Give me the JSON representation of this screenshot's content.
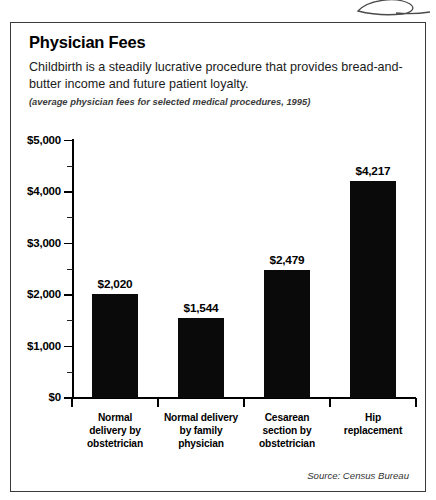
{
  "panel": {
    "title": "Physician Fees",
    "description": "Childbirth is a steadily lucrative procedure that provides bread-and-butter income and future patient loyalty.",
    "subtitle": "(average physician fees for selected medical procedures, 1995)",
    "source": "Source: Census Bureau"
  },
  "decoration": {
    "swoosh_icon": "swoosh-icon"
  },
  "chart_data": {
    "type": "bar",
    "title": "Physician Fees",
    "subtitle": "(average physician fees for selected medical procedures, 1995)",
    "description": "Childbirth is a steadily lucrative procedure that provides bread-and-butter income and future patient loyalty.",
    "source": "Source: Census Bureau",
    "xlabel": "",
    "ylabel": "",
    "ylim": [
      0,
      5000
    ],
    "grid": false,
    "legend": false,
    "bar_color": "#0a0a0a",
    "categories": [
      "Normal delivery by obstetrician",
      "Normal delivery by family physician",
      "Cesarean section by obstetrician",
      "Hip replacement"
    ],
    "category_lines": [
      [
        "Normal",
        "delivery by",
        "obstetrician"
      ],
      [
        "Normal delivery",
        "by family",
        "physician"
      ],
      [
        "Cesarean",
        "section by",
        "obstetrician"
      ],
      [
        "Hip",
        "replacement"
      ]
    ],
    "values": [
      2020,
      1544,
      2479,
      4217
    ],
    "value_labels": [
      "$2,020",
      "$1,544",
      "$2,479",
      "$4,217"
    ],
    "ytick_values": [
      0,
      1000,
      2000,
      3000,
      4000,
      5000
    ],
    "ytick_labels": [
      "$0",
      "$1,000",
      "$2,000",
      "$3,000",
      "$4,000",
      "$5,000"
    ],
    "yminor_values": [
      500,
      1500,
      2500,
      3500,
      4500
    ]
  }
}
